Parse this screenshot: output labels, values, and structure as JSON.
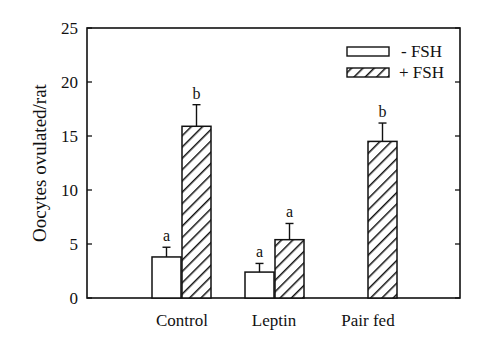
{
  "chart_data": {
    "type": "bar",
    "title": "",
    "xlabel": "",
    "ylabel": "Oocytes ovulated/rat",
    "ylim": [
      0,
      25
    ],
    "yticks": [
      0,
      5,
      10,
      15,
      20,
      25
    ],
    "grid": false,
    "legend_position": "top-right",
    "categories": [
      "Control",
      "Leptin",
      "Pair fed"
    ],
    "series": [
      {
        "name": "- FSH",
        "pattern": "open",
        "values": [
          3.8,
          2.4,
          null
        ],
        "errors": [
          0.9,
          0.8,
          null
        ],
        "labels": [
          "a",
          "a",
          null
        ]
      },
      {
        "name": "+ FSH",
        "pattern": "hatched",
        "values": [
          15.9,
          5.4,
          14.5
        ],
        "errors": [
          2.0,
          1.5,
          1.7
        ],
        "labels": [
          "b",
          "a",
          "b"
        ]
      }
    ]
  },
  "legend": {
    "minus": "- FSH",
    "plus": "+ FSH"
  },
  "yaxis": {
    "label": "Oocytes ovulated/rat",
    "ticks": [
      "0",
      "5",
      "10",
      "15",
      "20",
      "25"
    ]
  },
  "xaxis": {
    "ticks": [
      "Control",
      "Leptin",
      "Pair fed"
    ]
  }
}
